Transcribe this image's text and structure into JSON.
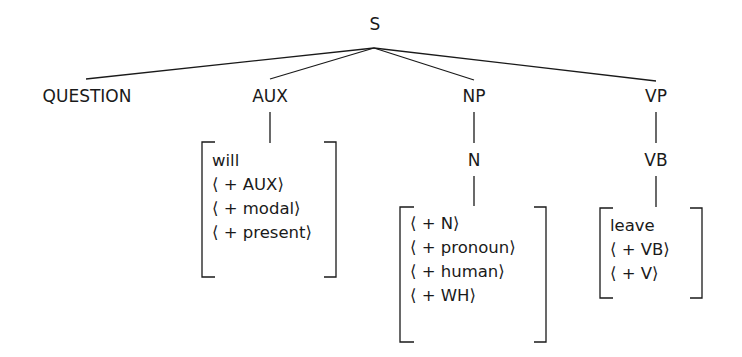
{
  "tree": {
    "root": "S",
    "children": [
      {
        "label": "QUESTION"
      },
      {
        "label": "AUX",
        "features": [
          "will",
          "⟨ + AUX⟩",
          "⟨ + modal⟩",
          "⟨ + present⟩"
        ]
      },
      {
        "label": "NP",
        "child": "N",
        "features": [
          "⟨ + N⟩",
          "⟨ + pronoun⟩",
          "⟨ + human⟩",
          "⟨ + WH⟩"
        ]
      },
      {
        "label": "VP",
        "child": "VB",
        "features": [
          "leave",
          "⟨ + VB⟩",
          "⟨ + V⟩"
        ]
      }
    ]
  }
}
